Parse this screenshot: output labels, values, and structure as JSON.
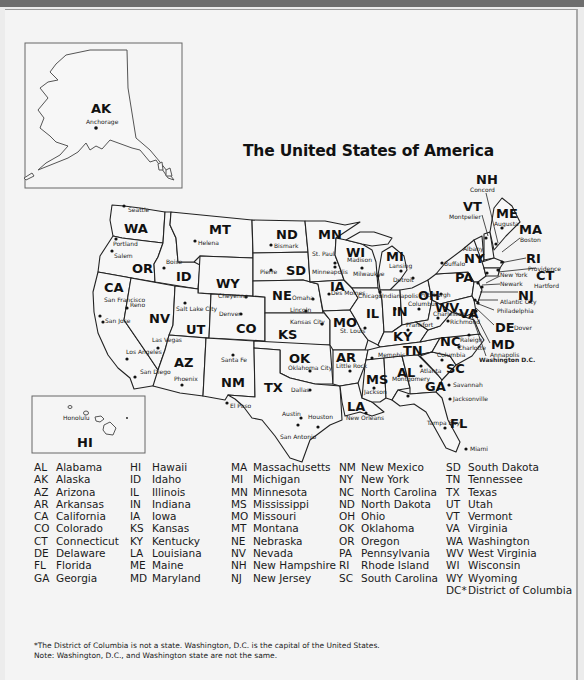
{
  "title": "The United States of America",
  "insets": {
    "alaska": {
      "abbr": "AK",
      "city": "Anchorage"
    },
    "hawaii": {
      "abbr": "HI",
      "city": "Honolulu"
    }
  },
  "states_on_map": [
    {
      "abbr": "WA",
      "cities": [
        "Seattle"
      ]
    },
    {
      "abbr": "OR",
      "cities": [
        "Portland",
        "Salem"
      ]
    },
    {
      "abbr": "CA",
      "cities": [
        "San Francisco",
        "San Jose",
        "Los Angeles",
        "San Diego"
      ]
    },
    {
      "abbr": "ID",
      "cities": [
        "Boise"
      ]
    },
    {
      "abbr": "NV",
      "cities": [
        "Reno",
        "Las Vegas"
      ]
    },
    {
      "abbr": "MT",
      "cities": [
        "Helena"
      ]
    },
    {
      "abbr": "WY",
      "cities": [
        "Cheyenne"
      ]
    },
    {
      "abbr": "UT",
      "cities": [
        "Salt Lake City"
      ]
    },
    {
      "abbr": "CO",
      "cities": [
        "Denver"
      ]
    },
    {
      "abbr": "AZ",
      "cities": [
        "Phoenix"
      ]
    },
    {
      "abbr": "NM",
      "cities": [
        "Santa Fe"
      ]
    },
    {
      "abbr": "ND",
      "cities": [
        "Bismark"
      ]
    },
    {
      "abbr": "SD",
      "cities": [
        "Pierre"
      ]
    },
    {
      "abbr": "NE",
      "cities": [
        "Omaha",
        "Lincoln"
      ]
    },
    {
      "abbr": "KS",
      "cities": [
        "Kansas City"
      ]
    },
    {
      "abbr": "OK",
      "cities": [
        "Oklahoma City"
      ]
    },
    {
      "abbr": "TX",
      "cities": [
        "El Paso",
        "Dallas",
        "Austin",
        "Houston",
        "San Antonio"
      ]
    },
    {
      "abbr": "MN",
      "cities": [
        "St. Paul",
        "Minneapolis"
      ]
    },
    {
      "abbr": "IA",
      "cities": [
        "Des Moines"
      ]
    },
    {
      "abbr": "MO",
      "cities": [
        "St. Louis"
      ]
    },
    {
      "abbr": "AR",
      "cities": [
        "Little Rock"
      ]
    },
    {
      "abbr": "LA",
      "cities": [
        "New Orleans"
      ]
    },
    {
      "abbr": "WI",
      "cities": [
        "Madison",
        "Milwaukee"
      ]
    },
    {
      "abbr": "IL",
      "cities": [
        "Chicago"
      ]
    },
    {
      "abbr": "MI",
      "cities": [
        "Lansing",
        "Detroit"
      ]
    },
    {
      "abbr": "IN",
      "cities": [
        "Indianapolis"
      ]
    },
    {
      "abbr": "OH",
      "cities": [
        "Columbus"
      ]
    },
    {
      "abbr": "KY",
      "cities": [
        "Frankfort"
      ]
    },
    {
      "abbr": "TN",
      "cities": [
        "Memphis"
      ]
    },
    {
      "abbr": "MS",
      "cities": [
        "Jackson"
      ]
    },
    {
      "abbr": "AL",
      "cities": [
        "Montgomery"
      ]
    },
    {
      "abbr": "GA",
      "cities": [
        "Atlanta",
        "Savannah"
      ]
    },
    {
      "abbr": "FL",
      "cities": [
        "Jacksonville",
        "Tampa Bay",
        "Miami"
      ]
    },
    {
      "abbr": "SC",
      "cities": [
        "Columbia"
      ]
    },
    {
      "abbr": "NC",
      "cities": [
        "Raleigh",
        "Charlotte"
      ]
    },
    {
      "abbr": "VA",
      "cities": [
        "Richmond"
      ]
    },
    {
      "abbr": "WV",
      "cities": [
        "Charleston"
      ]
    },
    {
      "abbr": "PA",
      "cities": [
        "Pittsburgh",
        "Philadelphia"
      ]
    },
    {
      "abbr": "NY",
      "cities": [
        "Albany",
        "Buffalo",
        "New York"
      ]
    },
    {
      "abbr": "NJ",
      "cities": [
        "Newark",
        "Atlantic City"
      ]
    },
    {
      "abbr": "DE",
      "cities": [
        "Dover"
      ]
    },
    {
      "abbr": "MD",
      "cities": [
        "Annapolis"
      ]
    },
    {
      "abbr": "CT",
      "cities": [
        "Hartford"
      ]
    },
    {
      "abbr": "RI",
      "cities": [
        "Providence"
      ]
    },
    {
      "abbr": "MA",
      "cities": [
        "Boston"
      ]
    },
    {
      "abbr": "VT",
      "cities": [
        "Montpelier"
      ]
    },
    {
      "abbr": "NH",
      "cities": [
        "Concord"
      ]
    },
    {
      "abbr": "ME",
      "cities": [
        "Augusta"
      ]
    }
  ],
  "capital_label": "Washington D.C.",
  "legend": {
    "columns": [
      [
        {
          "abbr": "AL",
          "name": "Alabama"
        },
        {
          "abbr": "AK",
          "name": "Alaska"
        },
        {
          "abbr": "AZ",
          "name": "Arizona"
        },
        {
          "abbr": "AR",
          "name": "Arkansas"
        },
        {
          "abbr": "CA",
          "name": "California"
        },
        {
          "abbr": "CO",
          "name": "Colorado"
        },
        {
          "abbr": "CT",
          "name": "Connecticut"
        },
        {
          "abbr": "DE",
          "name": "Delaware"
        },
        {
          "abbr": "FL",
          "name": "Florida"
        },
        {
          "abbr": "GA",
          "name": "Georgia"
        }
      ],
      [
        {
          "abbr": "HI",
          "name": "Hawaii"
        },
        {
          "abbr": "ID",
          "name": "Idaho"
        },
        {
          "abbr": "IL",
          "name": "Illinois"
        },
        {
          "abbr": "IN",
          "name": "Indiana"
        },
        {
          "abbr": "IA",
          "name": "Iowa"
        },
        {
          "abbr": "KS",
          "name": "Kansas"
        },
        {
          "abbr": "KY",
          "name": "Kentucky"
        },
        {
          "abbr": "LA",
          "name": "Louisiana"
        },
        {
          "abbr": "ME",
          "name": "Maine"
        },
        {
          "abbr": "MD",
          "name": "Maryland"
        }
      ],
      [
        {
          "abbr": "MA",
          "name": "Massachusetts"
        },
        {
          "abbr": "MI",
          "name": "Michigan"
        },
        {
          "abbr": "MN",
          "name": "Minnesota"
        },
        {
          "abbr": "MS",
          "name": "Mississippi"
        },
        {
          "abbr": "MO",
          "name": "Missouri"
        },
        {
          "abbr": "MT",
          "name": "Montana"
        },
        {
          "abbr": "NE",
          "name": "Nebraska"
        },
        {
          "abbr": "NV",
          "name": "Nevada"
        },
        {
          "abbr": "NH",
          "name": "New Hampshire"
        },
        {
          "abbr": "NJ",
          "name": "New Jersey"
        }
      ],
      [
        {
          "abbr": "NM",
          "name": "New Mexico"
        },
        {
          "abbr": "NY",
          "name": "New York"
        },
        {
          "abbr": "NC",
          "name": "North Carolina"
        },
        {
          "abbr": "ND",
          "name": "North Dakota"
        },
        {
          "abbr": "OH",
          "name": "Ohio"
        },
        {
          "abbr": "OK",
          "name": "Oklahoma"
        },
        {
          "abbr": "OR",
          "name": "Oregon"
        },
        {
          "abbr": "PA",
          "name": "Pennsylvania"
        },
        {
          "abbr": "RI",
          "name": "Rhode Island"
        },
        {
          "abbr": "SC",
          "name": "South Carolina"
        }
      ],
      [
        {
          "abbr": "SD",
          "name": "South Dakota"
        },
        {
          "abbr": "TN",
          "name": "Tennessee"
        },
        {
          "abbr": "TX",
          "name": "Texas"
        },
        {
          "abbr": "UT",
          "name": "Utah"
        },
        {
          "abbr": "VT",
          "name": "Vermont"
        },
        {
          "abbr": "VA",
          "name": "Virginia"
        },
        {
          "abbr": "WA",
          "name": "Washington"
        },
        {
          "abbr": "WV",
          "name": "West Virginia"
        },
        {
          "abbr": "WI",
          "name": "Wisconsin"
        },
        {
          "abbr": "WY",
          "name": "Wyoming"
        },
        {
          "abbr": "DC*",
          "name": "District of Columbia"
        }
      ]
    ]
  },
  "footnote": {
    "line1": "*The District of Columbia is not a state. Washington, D.C. is the capital of the United States.",
    "line2": "Note: Washington, D.C., and Washington state are not the same."
  },
  "colors": {
    "background": "#f4f4f4",
    "outline": "#222222",
    "topbar": "#6e6e6e"
  }
}
